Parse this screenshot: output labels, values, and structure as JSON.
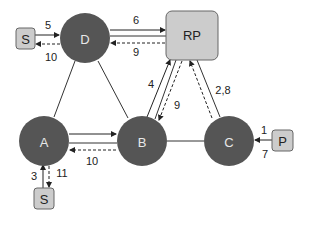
{
  "diagram": {
    "colors": {
      "router_fill": "#555555",
      "box_fill": "#cccccc",
      "box_stroke": "#666666",
      "line": "#333333"
    },
    "routers": {
      "D": {
        "label": "D"
      },
      "A": {
        "label": "A"
      },
      "B": {
        "label": "B"
      },
      "C": {
        "label": "C"
      }
    },
    "rp": {
      "label": "RP"
    },
    "sources": {
      "s_top": {
        "label": "S"
      },
      "s_bottom": {
        "label": "S"
      },
      "p": {
        "label": "P"
      }
    },
    "edge_labels": {
      "s_to_d": "5",
      "d_to_s": "10",
      "d_to_rp": "6",
      "rp_to_d": "9",
      "b_to_rp": "4",
      "rp_to_b": "9",
      "c_to_rp": "2,8",
      "a_to_b": "",
      "b_to_a": "10",
      "s_to_a": "3",
      "a_to_s": "11",
      "p_to_c_top": "1",
      "p_to_c_bottom": "7"
    }
  }
}
